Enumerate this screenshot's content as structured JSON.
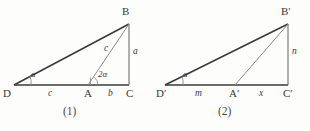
{
  "document": {
    "kind": "geometry-diagram",
    "background_color": "#fdfdfc",
    "ink_color": "#3a3a3a",
    "thin_ink_color": "#8a8a8a"
  },
  "figures": [
    {
      "id": "figure-1",
      "caption": "(1)",
      "vertices": {
        "B": "B",
        "D": "D",
        "A": "A",
        "C": "C"
      },
      "segment_labels": {
        "base_left": "c",
        "base_right": "b",
        "cevian": "c",
        "right_leg": "a"
      },
      "angle_labels": {
        "at_D": "α",
        "at_A": "2α"
      },
      "geometry": {
        "D": [
          14,
          85
        ],
        "A": [
          88,
          85
        ],
        "C": [
          129,
          85
        ],
        "B": [
          129,
          24
        ]
      }
    },
    {
      "id": "figure-2",
      "caption": "(2)",
      "vertices": {
        "B": "B′",
        "D": "D′",
        "A": "A′",
        "C": "C′"
      },
      "segment_labels": {
        "base_left": "m",
        "base_right": "x",
        "cevian": "",
        "right_leg": "n"
      },
      "angle_labels": {
        "at_D": "α",
        "at_A": ""
      },
      "geometry": {
        "D": [
          10,
          85
        ],
        "A": [
          80,
          85
        ],
        "C": [
          133,
          85
        ],
        "B": [
          133,
          24
        ]
      }
    }
  ]
}
